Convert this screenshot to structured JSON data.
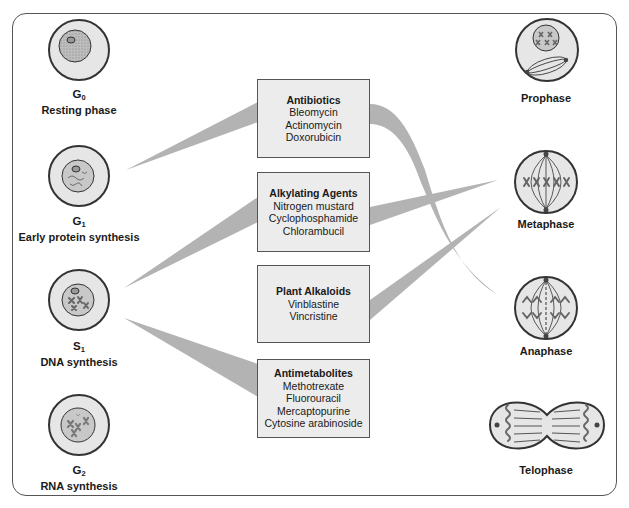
{
  "diagram": {
    "left_phases": [
      {
        "symbol": "G",
        "subscript": "0",
        "name": "Resting phase"
      },
      {
        "symbol": "G",
        "subscript": "1",
        "name": "Early protein synthesis"
      },
      {
        "symbol": "S",
        "subscript": "1",
        "name": "DNA synthesis"
      },
      {
        "symbol": "G",
        "subscript": "2",
        "name": "RNA synthesis"
      }
    ],
    "drug_classes": [
      {
        "title": "Antibiotics",
        "drugs": [
          "Bleomycin",
          "Actinomycin",
          "Doxorubicin"
        ]
      },
      {
        "title": "Alkylating Agents",
        "drugs": [
          "Nitrogen mustard",
          "Cyclophosphamide",
          "Chlorambucil"
        ]
      },
      {
        "title": "Plant Alkaloids",
        "drugs": [
          "Vinblastine",
          "Vincristine"
        ]
      },
      {
        "title": "Antimetabolites",
        "drugs": [
          "Methotrexate",
          "Fluorouracil",
          "Mercaptopurine",
          "Cytosine arabinoside"
        ]
      }
    ],
    "right_phases": [
      {
        "name": "Prophase"
      },
      {
        "name": "Metaphase"
      },
      {
        "name": "Anaphase"
      },
      {
        "name": "Telophase"
      }
    ],
    "colors": {
      "connector": "#b3b3b3",
      "box_fill": "#ececec",
      "cell_fill": "#e6e6e6",
      "nucleus_fill": "#c8c8c8",
      "outline": "#333333"
    }
  }
}
